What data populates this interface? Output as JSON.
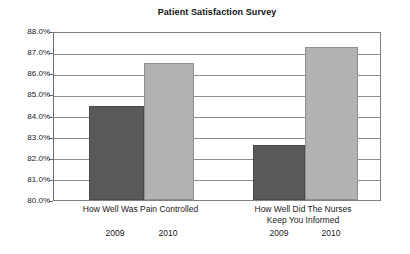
{
  "chart_data": {
    "type": "bar",
    "title": "Patient Satisfaction Survey",
    "xlabel": "",
    "ylabel": "",
    "ylim": [
      80.0,
      88.0
    ],
    "ytick_labels": [
      "88.0%",
      "87.0%",
      "86.0%",
      "85.0%",
      "84.0%",
      "83.0%",
      "82.0%",
      "81.0%",
      "80.0%"
    ],
    "ytick_values": [
      88.0,
      87.0,
      86.0,
      85.0,
      84.0,
      83.0,
      82.0,
      81.0,
      80.0
    ],
    "grid": true,
    "legend": "none",
    "categories": [
      "How Well Was Pain Controlled",
      "How Well Did The Nurses Keep You Informed"
    ],
    "category_lines": [
      [
        "How Well Was Pain Controlled"
      ],
      [
        "How Well Did The Nurses",
        "Keep You Informed"
      ]
    ],
    "series": [
      {
        "name": "2009",
        "color": "#595959",
        "values": [
          84.45,
          82.6
        ]
      },
      {
        "name": "2010",
        "color": "#b2b2b2",
        "values": [
          86.5,
          87.25
        ]
      }
    ],
    "bars": [
      {
        "group": 0,
        "series": "2009",
        "value": 84.45,
        "label": "2009"
      },
      {
        "group": 0,
        "series": "2010",
        "value": 86.5,
        "label": "2010"
      },
      {
        "group": 1,
        "series": "2009",
        "value": 82.6,
        "label": "2009"
      },
      {
        "group": 1,
        "series": "2010",
        "value": 87.25,
        "label": "2010"
      }
    ]
  }
}
